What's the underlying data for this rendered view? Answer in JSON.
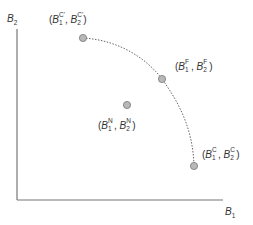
{
  "diagram": {
    "axes": {
      "y_label": {
        "base": "B",
        "sub": "2"
      },
      "x_label": {
        "base": "B",
        "sub": "1"
      },
      "color": "#777777"
    },
    "curve": {
      "style": "dotted",
      "description": "frontier arc from (B1^C', B2^C') through (B1^F, B2^F) to (B1^C, B2^C)",
      "color": "#666666"
    },
    "points": [
      {
        "id": "C-prime",
        "sup": "C'",
        "label_open": "(",
        "b": "B",
        "s1": "1",
        "s2": "2",
        "sep": ", ",
        "label_close": ")",
        "x": 83,
        "y": 38
      },
      {
        "id": "F",
        "sup": "F",
        "label_open": "(",
        "b": "B",
        "s1": "1",
        "s2": "2",
        "sep": ", ",
        "label_close": ")",
        "x": 162,
        "y": 79
      },
      {
        "id": "N",
        "sup": "N",
        "label_open": "(",
        "b": "B",
        "s1": "1",
        "s2": "2",
        "sep": ", ",
        "label_close": ")",
        "x": 127,
        "y": 105
      },
      {
        "id": "C",
        "sup": "C",
        "label_open": "(",
        "b": "B",
        "s1": "1",
        "s2": "2",
        "sep": ", ",
        "label_close": ")",
        "x": 194,
        "y": 166
      }
    ],
    "point_fill": "#b8b8b8",
    "point_stroke": "#777777"
  }
}
